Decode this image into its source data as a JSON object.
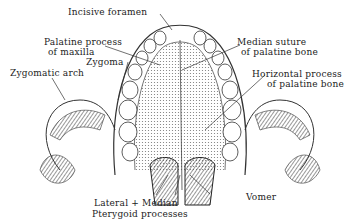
{
  "figure": {
    "labels": {
      "incisive_foramen": "Incisive foramen",
      "palatine_process_l1": "Palatine process",
      "palatine_process_l2": "of maxilla",
      "zygoma": "Zygoma",
      "zygomatic_arch": "Zygomatic arch",
      "median_suture_l1": "Median suture",
      "median_suture_l2": "of palatine bone",
      "horizontal_process_l1": "Horizontal process",
      "horizontal_process_l2": "of palatine bone",
      "pterygoid_l1": "Lateral + Median",
      "pterygoid_l2": "Pterygoid processes",
      "vomer": "Vomer"
    }
  }
}
